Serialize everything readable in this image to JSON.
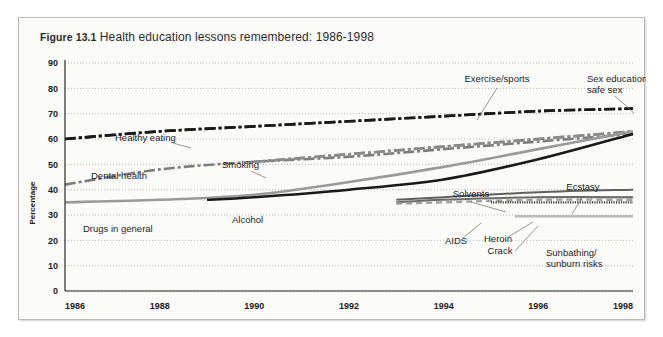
{
  "figure": {
    "number": "Figure 13.1",
    "title": "Health education lessons remembered: 1986-1998"
  },
  "chart_data": {
    "type": "line",
    "title": "Health education lessons remembered: 1986-1998",
    "xlabel": "",
    "ylabel": "Percentage",
    "xlim": [
      1986,
      1998
    ],
    "ylim": [
      0,
      90
    ],
    "grid": true,
    "legend": "inline-annotations",
    "xticks": [
      "1986",
      "1988",
      "1990",
      "1992",
      "1994",
      "1996",
      "1998"
    ],
    "yticks": [
      "0",
      "10",
      "20",
      "30",
      "40",
      "50",
      "60",
      "70",
      "80",
      "90"
    ],
    "series": [
      {
        "name": "Healthy eating",
        "label": "Healthy eating",
        "color": "#1a1a1a",
        "width": 2.6,
        "dash": "11 3 3 3",
        "label_x": 96,
        "label_y": 123,
        "anchor": "start",
        "leader": [
          [
            154,
            125
          ],
          [
            172,
            130
          ]
        ],
        "x": [
          1986,
          1988,
          1990,
          1992,
          1994,
          1996,
          1998
        ],
        "values": [
          60,
          63,
          65,
          67,
          69,
          71,
          72
        ]
      },
      {
        "name": "Dental health",
        "label": "Dental health",
        "color": "#7d7d7d",
        "width": 2.6,
        "dash": "11 3 3 3",
        "label_x": 72,
        "label_y": 161,
        "anchor": "start",
        "leader": [],
        "x": [
          1986,
          1988,
          1990,
          1992,
          1994,
          1996,
          1998
        ],
        "values": [
          42,
          48,
          51,
          53,
          56,
          59,
          62
        ]
      },
      {
        "name": "Smoking",
        "label": "Smoking",
        "color": "#8a8a8a",
        "width": 2.6,
        "dash": "11 3 3 3",
        "label_x": 203,
        "label_y": 150,
        "anchor": "start",
        "leader": [
          [
            232,
            153
          ],
          [
            247,
            160
          ]
        ],
        "x": [
          1990,
          1992,
          1994,
          1996,
          1998
        ],
        "values": [
          51,
          54,
          57,
          60,
          63
        ]
      },
      {
        "name": "Exercise/sports",
        "label": "Exercise/sports",
        "color": "#1a1a1a",
        "width": 2.6,
        "dash": "11 3 3 3",
        "label_x": 478,
        "label_y": 64,
        "anchor": "middle",
        "leader": [
          [
            478,
            70
          ],
          [
            458,
            102
          ]
        ],
        "x": [
          1986,
          1988,
          1990,
          1992,
          1994,
          1996,
          1998
        ],
        "values": [
          60,
          63,
          65,
          67,
          69,
          71,
          72
        ]
      },
      {
        "name": "Sex education/safe sex",
        "label": "Sex education/",
        "label2": "safe sex",
        "color": "#8a8a8a",
        "width": 2.6,
        "dash": "11 3 3 3",
        "label_x": 568,
        "label_y": 64,
        "anchor": "start",
        "leader": [
          [
            596,
            78
          ],
          [
            615,
            95
          ]
        ],
        "x": [
          1990,
          1992,
          1994,
          1996,
          1998
        ],
        "values": [
          51,
          54,
          57,
          60,
          63
        ]
      },
      {
        "name": "Drugs in general",
        "label": "Drugs in general",
        "color": "#9a9a9a",
        "width": 2.6,
        "dash": "",
        "label_x": 64,
        "label_y": 214,
        "anchor": "start",
        "leader": [],
        "x": [
          1986,
          1988,
          1990,
          1992,
          1994,
          1996,
          1998
        ],
        "values": [
          35,
          36,
          38,
          43,
          49,
          56,
          63
        ]
      },
      {
        "name": "Alcohol",
        "label": "Alcohol",
        "color": "#1a1a1a",
        "width": 2.6,
        "dash": "",
        "label_x": 213,
        "label_y": 205,
        "anchor": "start",
        "leader": [],
        "x": [
          1989,
          1990,
          1992,
          1994,
          1996,
          1998
        ],
        "values": [
          36,
          37,
          40,
          44,
          52,
          62
        ]
      },
      {
        "name": "Solvents",
        "label": "Solvents",
        "color": "#5f5f5f",
        "width": 2.0,
        "dash": "",
        "label_x": 452,
        "label_y": 179,
        "anchor": "middle",
        "leader": [
          [
            452,
            184
          ],
          [
            487,
            194
          ]
        ],
        "x": [
          1993,
          1994,
          1996,
          1998
        ],
        "values": [
          36,
          37,
          39,
          40
        ]
      },
      {
        "name": "Ecstasy",
        "label": "Ecstasy",
        "color": "#8c8c8c",
        "width": 1.8,
        "dash": "2 1.5",
        "label_x": 564,
        "label_y": 172,
        "anchor": "middle",
        "leader": [
          [
            564,
            178
          ],
          [
            553,
            196
          ]
        ],
        "x": [
          1996,
          1998
        ],
        "values": [
          37,
          37
        ]
      },
      {
        "name": "AIDS",
        "label": "AIDS",
        "color": "#6a6a6a",
        "width": 2.0,
        "dash": "",
        "label_x": 437,
        "label_y": 226,
        "anchor": "middle",
        "leader": [
          [
            444,
            220
          ],
          [
            462,
            205
          ]
        ],
        "x": [
          1993,
          1994,
          1996,
          1998
        ],
        "values": [
          35,
          36,
          37,
          37
        ]
      },
      {
        "name": "Heroin",
        "label": "Heroin",
        "color": "#a0a0a0",
        "width": 2.4,
        "dash": "6 4",
        "label_x": 479,
        "label_y": 224,
        "anchor": "middle",
        "leader": [
          [
            489,
            219
          ],
          [
            514,
            204
          ]
        ],
        "x": [
          1993,
          1994,
          1996,
          1998
        ],
        "values": [
          34.5,
          35,
          36,
          36
        ]
      },
      {
        "name": "Crack",
        "label": "Crack",
        "color": "#3a3a3a",
        "width": 2.4,
        "dash": "1.2 1.2",
        "label_x": 481,
        "label_y": 236,
        "anchor": "middle",
        "leader": [
          [
            496,
            233
          ],
          [
            519,
            208
          ]
        ],
        "x": [
          1995,
          1996,
          1998
        ],
        "values": [
          35,
          35,
          35
        ]
      },
      {
        "name": "Sunbathing/sunburn risks",
        "label": "Sunbathing/",
        "label2": "sunburn risks",
        "color": "#bcbcbc",
        "width": 2.4,
        "dash": "",
        "label_x": 527,
        "label_y": 238,
        "anchor": "start",
        "leader": [],
        "x": [
          1995.5,
          1998
        ],
        "values": [
          29.5,
          29.5
        ]
      }
    ]
  }
}
